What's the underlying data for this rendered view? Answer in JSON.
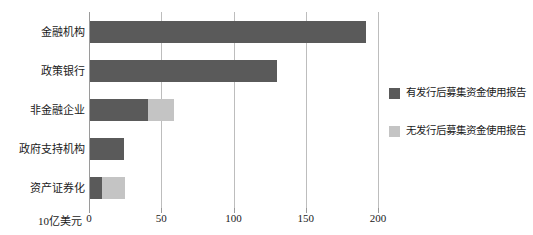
{
  "chart_data": {
    "type": "bar",
    "orientation": "horizontal",
    "stacked": true,
    "title": "",
    "xlabel": "10亿美元",
    "ylabel": "",
    "xlim": [
      0,
      200
    ],
    "xticks": [
      0,
      50,
      100,
      150,
      200
    ],
    "xtick_labels": [
      "0",
      "50",
      "100",
      "150",
      "200"
    ],
    "grid": true,
    "legend_position": "right",
    "categories": [
      "金融机构",
      "政策银行",
      "非金融企业",
      "政府支持机构",
      "资产证券化"
    ],
    "series": [
      {
        "name": "有发行后募集资金使用报告",
        "color": "#5a5a5a",
        "values": [
          192,
          130,
          41,
          24,
          9
        ]
      },
      {
        "name": "无发行后募集资金使用报告",
        "color": "#c4c4c4",
        "values": [
          0,
          0,
          18,
          0,
          16
        ]
      }
    ]
  },
  "axis": {
    "unit_label": "10亿美元"
  },
  "legend": {
    "items": [
      {
        "label": "有发行后募集资金使用报告",
        "color": "#5a5a5a"
      },
      {
        "label": "无发行后募集资金使用报告",
        "color": "#c4c4c4"
      }
    ]
  }
}
